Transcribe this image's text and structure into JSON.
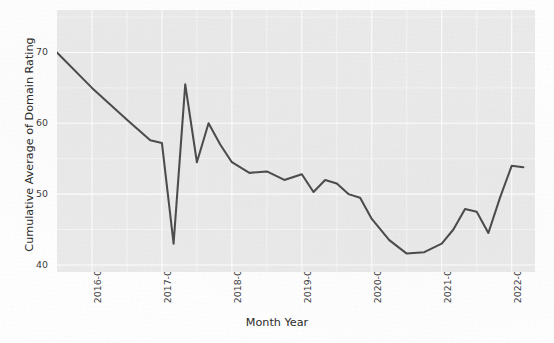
{
  "chart_data": {
    "type": "line",
    "title": "",
    "subtitle": "",
    "xlabel": "Month Year",
    "ylabel": "Cumulative Average of Domain Rating",
    "grid": true,
    "legend": false,
    "legend_position": "none",
    "line_color": "#4d4d4d",
    "panel_color": "#ebebeb",
    "gridline_color": "#ffffff",
    "ylim": [
      39.0,
      76.0
    ],
    "yticks": [
      40,
      50,
      60,
      70
    ],
    "ytick_labels": [
      "40",
      "50",
      "60",
      "70"
    ],
    "xticks": [
      "2016-01-01",
      "2017-01-01",
      "2018-01-01",
      "2019-01-01",
      "2020-01-01",
      "2021-01-01",
      "2022-01-01"
    ],
    "xtick_labels": [
      "2016-01-01",
      "2017-01-01",
      "2018-01-01",
      "2019-01-01",
      "2020-01-01",
      "2021-01-01",
      "2022-01-01"
    ],
    "xlim": [
      "2015-07-01",
      "2022-05-01"
    ],
    "series": [
      {
        "name": "Cumulative Average of Domain Rating",
        "x": [
          "2015-07-01",
          "2016-01-01",
          "2016-07-01",
          "2016-11-01",
          "2017-01-01",
          "2017-03-01",
          "2017-05-01",
          "2017-07-01",
          "2017-09-01",
          "2017-11-01",
          "2018-01-01",
          "2018-04-01",
          "2018-07-01",
          "2018-10-01",
          "2019-01-01",
          "2019-03-01",
          "2019-05-01",
          "2019-07-01",
          "2019-09-01",
          "2019-11-01",
          "2020-01-01",
          "2020-04-01",
          "2020-07-01",
          "2020-10-01",
          "2021-01-01",
          "2021-03-01",
          "2021-05-01",
          "2021-07-01",
          "2021-09-01",
          "2021-11-01",
          "2022-01-01",
          "2022-03-01"
        ],
        "values": [
          70.0,
          65.0,
          60.5,
          57.6,
          57.2,
          43.0,
          65.5,
          54.5,
          60.0,
          57.0,
          54.5,
          53.0,
          53.2,
          52.0,
          52.8,
          50.3,
          52.0,
          51.5,
          50.0,
          49.5,
          46.5,
          43.5,
          41.6,
          41.8,
          43.0,
          45.0,
          47.9,
          47.5,
          44.5,
          49.5,
          54.0,
          53.8
        ]
      }
    ],
    "annotations": []
  },
  "axes": {
    "y_title": "Cumulative Average of Domain Rating",
    "x_title": "Month Year"
  }
}
